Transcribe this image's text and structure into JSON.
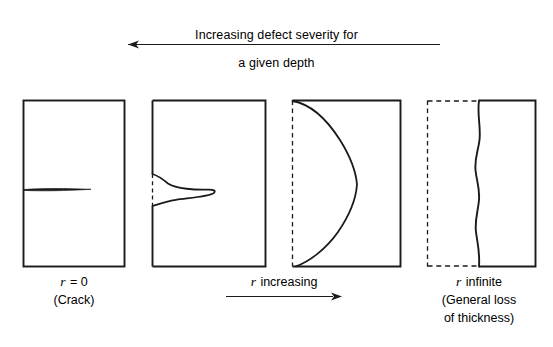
{
  "figure": {
    "top_caption": {
      "line1": "Increasing defect severity for",
      "line2": "a given depth",
      "arrow_direction": "left",
      "arrow_name": "increasing-severity-arrow"
    },
    "bottom_caption": {
      "label": "r increasing",
      "label_symbol": "r",
      "label_text": " increasing",
      "arrow_direction": "right",
      "arrow_name": "r-increasing-arrow"
    },
    "panels": [
      {
        "id": "panel-crack",
        "label_symbol": "r",
        "label_value": " = 0",
        "label_line1": "r = 0",
        "label_line2": "(Crack)",
        "defect": "crack",
        "border_style": "solid",
        "left_edge_style": "solid"
      },
      {
        "id": "panel-notch",
        "label_line1": "",
        "label_line2": "",
        "defect": "narrow-notch",
        "border_style": "solid",
        "left_edge_style": "partially-dashed"
      },
      {
        "id": "panel-wide-defect",
        "label_line1": "",
        "label_line2": "",
        "defect": "wide-rounded-defect",
        "border_style": "solid",
        "left_edge_style": "dashed"
      },
      {
        "id": "panel-general-loss",
        "label_symbol": "r",
        "label_value": " infinite",
        "label_line1": "r infinite",
        "label_line2": "(General loss",
        "label_line3": "of thickness)",
        "defect": "general-thickness-loss",
        "border_style": "mixed-dashed-solid",
        "left_edge_style": "dashed"
      }
    ],
    "colors": {
      "line": "#1a1a1a",
      "background": "#ffffff",
      "text": "#111111"
    }
  }
}
